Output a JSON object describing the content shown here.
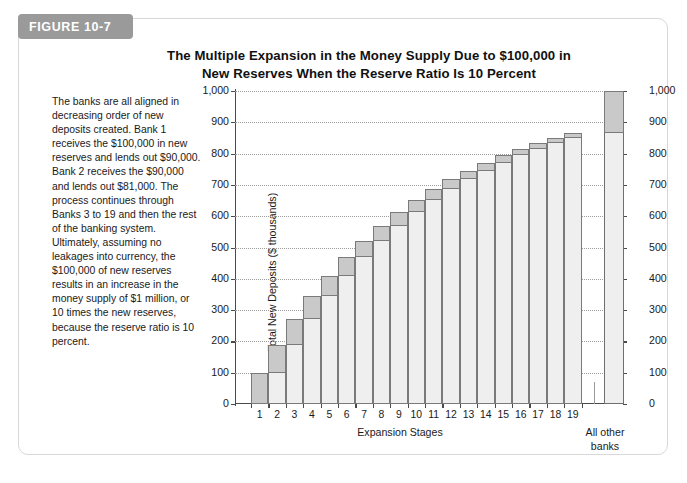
{
  "figure": {
    "tab_label": "FIGURE 10-7",
    "title_line1": "The Multiple Expansion in the Money Supply Due to $100,000 in",
    "title_line2": "New Reserves When the Reserve Ratio Is 10 Percent",
    "caption": "The banks are all aligned in decreasing order of new deposits created. Bank 1 receives the $100,000 in new reserves and lends out $90,000. Bank 2 receives the $90,000 and lends out $81,000. The process continues through Banks 3 to 19 and then the rest of the banking system. Ultimately, assuming no leakages into currency, the $100,000 of new reserves results in an increase in the money supply of $1 million, or 10 times the new reserves, because the reserve ratio is 10 percent."
  },
  "colors": {
    "tab_background": "#9a9a9a",
    "tab_text": "#ffffff",
    "bar_base": "#efefef",
    "bar_increment": "#c9c9c9",
    "bar_outline": "#7a7a7a",
    "axis": "#4a4a4a",
    "gridline": "#9c9c9c",
    "card_border": "#d8d8d8",
    "text": "#1a1a1a"
  },
  "chart_data": {
    "type": "bar",
    "title": "The Multiple Expansion in the Money Supply Due to $100,000 in New Reserves When the Reserve Ratio Is 10 Percent",
    "xlabel": "Expansion Stages",
    "ylabel": "Total New Deposits ($ thousands)",
    "ylim": [
      0,
      1000
    ],
    "ytick_labels": [
      "0",
      "100",
      "200",
      "300",
      "400",
      "500",
      "600",
      "700",
      "800",
      "900",
      "1,000"
    ],
    "ytick_values": [
      0,
      100,
      200,
      300,
      400,
      500,
      600,
      700,
      800,
      900,
      1000
    ],
    "grid": true,
    "legend": "none",
    "right_axis_labels": [
      "0",
      "100",
      "200",
      "300",
      "400",
      "500",
      "600",
      "700",
      "800",
      "900",
      "1,000"
    ],
    "extra_category_label_line1": "All other",
    "extra_category_label_line2": "banks",
    "categories": [
      "1",
      "2",
      "3",
      "4",
      "5",
      "6",
      "7",
      "8",
      "9",
      "10",
      "11",
      "12",
      "13",
      "14",
      "15",
      "16",
      "17",
      "18",
      "19",
      "All other banks"
    ],
    "cumulative_totals": [
      100,
      190,
      271,
      344,
      410,
      469,
      522,
      570,
      613,
      651,
      686,
      718,
      746,
      771,
      794,
      815,
      833,
      850,
      865,
      1000
    ],
    "increments": [
      100,
      90,
      81,
      73,
      66,
      59,
      53,
      48,
      43,
      39,
      35,
      31,
      28,
      25,
      23,
      21,
      18,
      17,
      15,
      135
    ],
    "bar_base_values": [
      0,
      100,
      190,
      271,
      344,
      410,
      469,
      522,
      570,
      613,
      651,
      686,
      718,
      746,
      771,
      794,
      815,
      833,
      850,
      865
    ],
    "annotations": []
  }
}
